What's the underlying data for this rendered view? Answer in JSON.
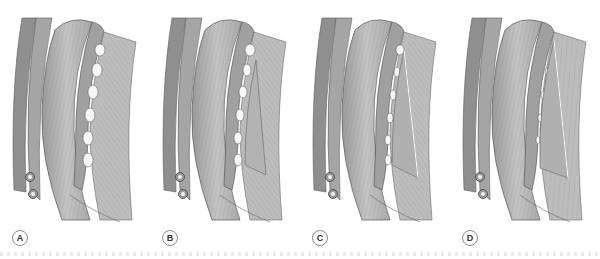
{
  "figure": {
    "panels": [
      {
        "label": "A",
        "variant": "intact-intercostals"
      },
      {
        "label": "B",
        "variant": "partial-triangle"
      },
      {
        "label": "C",
        "variant": "larger-triangle"
      },
      {
        "label": "D",
        "variant": "full-triangle"
      }
    ],
    "colors": {
      "muscle_light": "#b9b9b9",
      "muscle_mid": "#a3a3a3",
      "muscle_dark": "#8c8c8c",
      "outline": "#5a5a5a",
      "fiber": "#7d7d7d",
      "background": "#ffffff"
    }
  }
}
